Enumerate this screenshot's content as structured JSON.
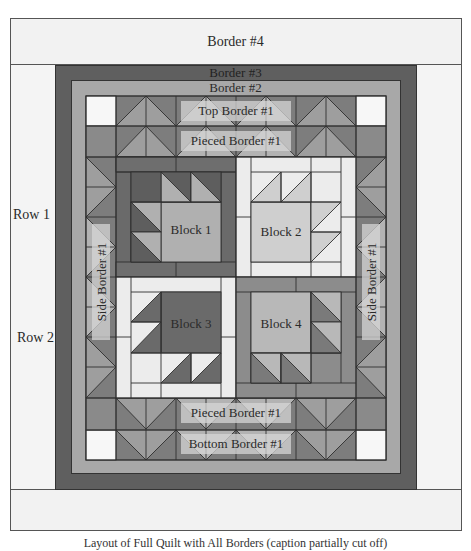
{
  "diagram": {
    "colors": {
      "background": "#ffffff",
      "outer_frame": "#f0f0f0",
      "border4": "#f2f2f2",
      "border3": "#5a5a5a",
      "border2": "#a9a9a9",
      "dark": "#6e6e6e",
      "medium": "#9a9a9a",
      "light": "#c4c4c4",
      "lightest": "#ececec",
      "white_square": "#f7f7f7",
      "label_box": "#c8c8c8",
      "line": "#333333"
    },
    "labels": {
      "border4": "Border #4",
      "border3": "Border #3",
      "border2": "Border #2",
      "top_border1": "Top Border #1",
      "pieced_border1_top": "Pieced Border #1",
      "pieced_border1_bottom": "Pieced Border #1",
      "bottom_border1": "Bottom Border #1",
      "side_border1_left": "Side Border #1",
      "side_border1_right": "Side Border #1",
      "row1": "Row 1",
      "row2": "Row 2",
      "block1": "Block 1",
      "block2": "Block 2",
      "block3": "Block 3",
      "block4": "Block 4"
    },
    "caption": "Layout of Full Quilt with All Borders (caption partially cut off)"
  }
}
